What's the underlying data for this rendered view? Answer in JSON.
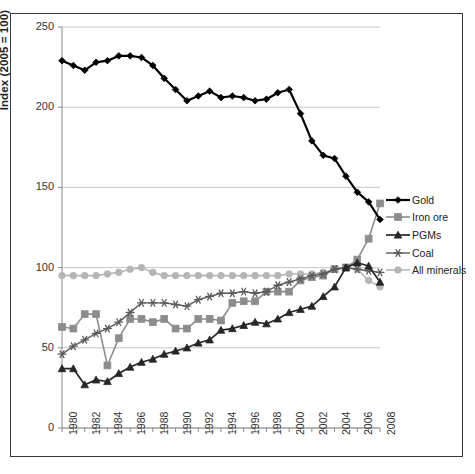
{
  "chart_data": {
    "type": "line",
    "title": "",
    "xlabel": "",
    "ylabel": "Index (2005 = 100)",
    "ylim": [
      0,
      250
    ],
    "yticks": [
      0,
      50,
      100,
      150,
      200,
      250
    ],
    "grid": true,
    "legend_position": "right",
    "x": [
      1980,
      1981,
      1982,
      1983,
      1984,
      1985,
      1986,
      1987,
      1988,
      1989,
      1990,
      1991,
      1992,
      1993,
      1994,
      1995,
      1996,
      1997,
      1998,
      1999,
      2000,
      2001,
      2002,
      2003,
      2004,
      2005,
      2006,
      2007,
      2008
    ],
    "xtick_labels": [
      "1980",
      "1982",
      "1984",
      "1986",
      "1988",
      "1990",
      "1992",
      "1994",
      "1996",
      "1998",
      "2000",
      "2002",
      "2004",
      "2006",
      "2008"
    ],
    "series": [
      {
        "name": "Gold",
        "color": "#000000",
        "marker": "diamond",
        "values": [
          229,
          226,
          223,
          228,
          229,
          232,
          232,
          231,
          226,
          218,
          211,
          204,
          207,
          210,
          206,
          207,
          206,
          204,
          205,
          209,
          211,
          196,
          179,
          170,
          168,
          157,
          147,
          141,
          130
        ]
      },
      {
        "name": "Iron ore",
        "color": "#8c8c8c",
        "marker": "square",
        "values": [
          63,
          62,
          71,
          71,
          39,
          56,
          68,
          68,
          66,
          68,
          62,
          62,
          68,
          68,
          67,
          78,
          79,
          79,
          85,
          85,
          85,
          92,
          94,
          95,
          99,
          100,
          105,
          118,
          140
        ]
      },
      {
        "name": "PGMs",
        "color": "#262626",
        "marker": "triangle",
        "values": [
          37,
          37,
          27,
          30,
          29,
          34,
          38,
          41,
          43,
          46,
          48,
          50,
          53,
          55,
          61,
          62,
          64,
          66,
          65,
          68,
          72,
          74,
          76,
          82,
          88,
          100,
          103,
          101,
          91
        ]
      },
      {
        "name": "Coal",
        "color": "#5a5a5a",
        "marker": "star",
        "values": [
          46,
          51,
          55,
          59,
          62,
          66,
          72,
          78,
          78,
          78,
          77,
          76,
          80,
          82,
          84,
          84,
          85,
          84,
          85,
          89,
          91,
          93,
          95,
          96,
          99,
          100,
          99,
          98,
          97
        ]
      },
      {
        "name": "All minerals",
        "color": "#b5b5b5",
        "marker": "circle",
        "values": [
          95,
          95,
          95,
          95,
          96,
          97,
          99,
          100,
          97,
          95,
          95,
          95,
          95,
          95,
          95,
          95,
          95,
          95,
          95,
          95,
          96,
          96,
          96,
          97,
          99,
          100,
          99,
          92,
          88
        ]
      }
    ]
  },
  "axis": {
    "y_title": "Index (2005 = 100)",
    "y_tick_labels": [
      "250",
      "200",
      "150",
      "100",
      "50",
      "0"
    ]
  },
  "legend": {
    "items": [
      {
        "label": "Gold"
      },
      {
        "label": "Iron ore"
      },
      {
        "label": "PGMs"
      },
      {
        "label": "Coal"
      },
      {
        "label": "All minerals"
      }
    ]
  },
  "caption": {
    "text": ""
  }
}
